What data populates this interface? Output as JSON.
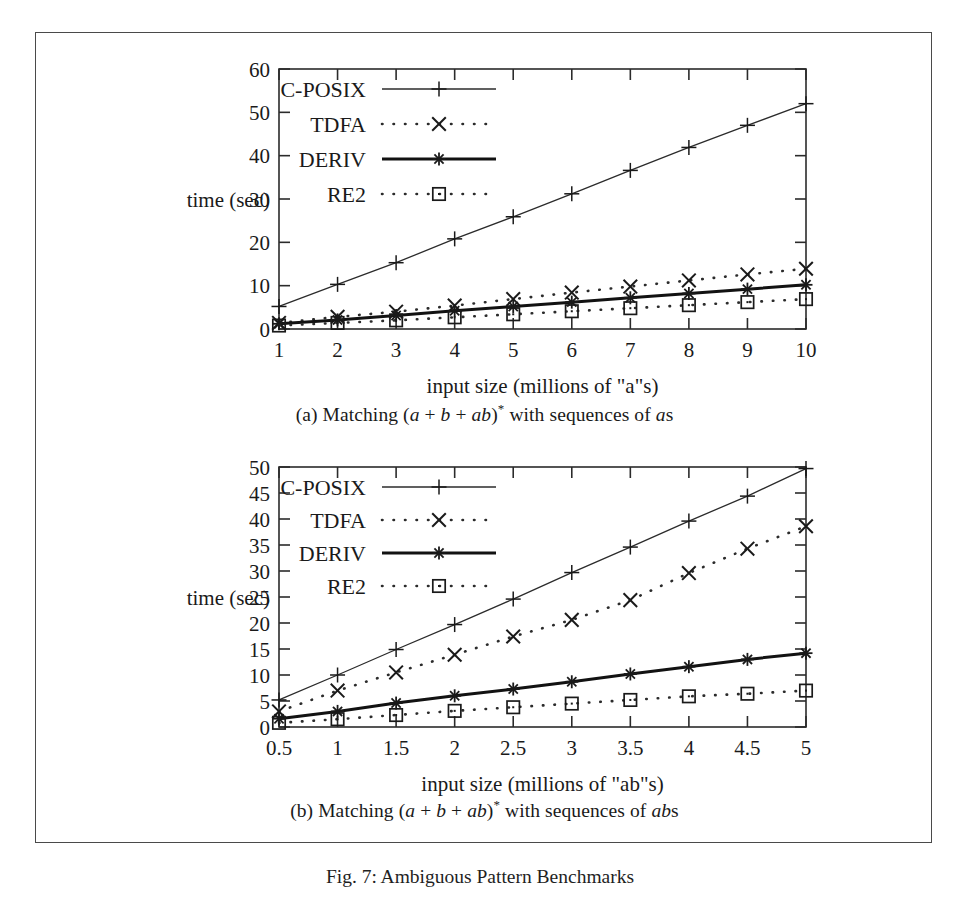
{
  "figure": {
    "caption_prefix": "Fig. 7:",
    "caption_text": "Fig. 7: Ambiguous Pattern Benchmarks"
  },
  "panel_a": {
    "caption_lead": "(a) Matching (",
    "caption_full": "(a) Matching (a + b + ab)* with sequences of as",
    "expr_a1": "a",
    "expr_plus1": " + ",
    "expr_b": "b",
    "expr_plus2": " + ",
    "expr_ab": "ab",
    "expr_close": ")",
    "expr_star": "*",
    "caption_tail": " with sequences of ",
    "caption_tail_ital": "a",
    "caption_tail_end": "s"
  },
  "panel_b": {
    "caption_lead": "(b) Matching (",
    "caption_full": "(b) Matching (a + b + ab)* with sequences of abs",
    "expr_a1": "a",
    "expr_plus1": " + ",
    "expr_b": "b",
    "expr_plus2": " + ",
    "expr_ab": "ab",
    "expr_close": ")",
    "expr_star": "*",
    "caption_tail": " with sequences of ",
    "caption_tail_ital": "ab",
    "caption_tail_end": "s"
  },
  "legend_markers": {
    "cposix": "plus-marker",
    "tdfa": "cross-marker",
    "deriv": "star-marker",
    "re2": "square-marker"
  },
  "chart_data": [
    {
      "id": "chart-a",
      "type": "line",
      "title": "",
      "xlabel": "input size (millions of \"a\"s)",
      "ylabel": "time (sec)",
      "xlim": [
        1,
        10
      ],
      "ylim": [
        0,
        60
      ],
      "xticks": [
        1,
        2,
        3,
        4,
        5,
        6,
        7,
        8,
        9,
        10
      ],
      "xtick_labels": [
        "1",
        "2",
        "3",
        "4",
        "5",
        "6",
        "7",
        "8",
        "9",
        "10"
      ],
      "yticks": [
        0,
        10,
        20,
        30,
        40,
        50,
        60
      ],
      "ytick_labels": [
        "0",
        "10",
        "20",
        "30",
        "40",
        "50",
        "60"
      ],
      "grid": false,
      "legend_position": "top-left-inside",
      "x": [
        1,
        2,
        3,
        4,
        5,
        6,
        7,
        8,
        9,
        10
      ],
      "series": [
        {
          "name": "C-POSIX",
          "marker": "plus",
          "style": "solid-thin",
          "values": [
            5.2,
            10.3,
            15.3,
            20.8,
            25.9,
            31.2,
            36.6,
            41.9,
            47.0,
            52.0
          ]
        },
        {
          "name": "TDFA",
          "marker": "cross",
          "style": "dotted",
          "values": [
            1.4,
            2.8,
            4.0,
            5.4,
            6.9,
            8.4,
            9.8,
            11.2,
            12.6,
            13.9
          ]
        },
        {
          "name": "DERIV",
          "marker": "star",
          "style": "solid-thick",
          "values": [
            1.2,
            2.1,
            3.1,
            4.2,
            5.2,
            6.2,
            7.2,
            8.2,
            9.2,
            10.2
          ]
        },
        {
          "name": "RE2",
          "marker": "square",
          "style": "dotted",
          "values": [
            0.8,
            1.4,
            2.0,
            2.7,
            3.4,
            4.1,
            4.8,
            5.5,
            6.2,
            6.9
          ]
        }
      ]
    },
    {
      "id": "chart-b",
      "type": "line",
      "title": "",
      "xlabel": "input size (millions of \"ab\"s)",
      "ylabel": "time (sec)",
      "xlim": [
        0.5,
        5
      ],
      "ylim": [
        0,
        50
      ],
      "xticks": [
        0.5,
        1,
        1.5,
        2,
        2.5,
        3,
        3.5,
        4,
        4.5,
        5
      ],
      "xtick_labels": [
        "0.5",
        "1",
        "1.5",
        "2",
        "2.5",
        "3",
        "3.5",
        "4",
        "4.5",
        "5"
      ],
      "yticks": [
        0,
        5,
        10,
        15,
        20,
        25,
        30,
        35,
        40,
        45,
        50
      ],
      "ytick_labels": [
        "0",
        "5",
        "10",
        "15",
        "20",
        "25",
        "30",
        "35",
        "40",
        "45",
        "50"
      ],
      "grid": false,
      "legend_position": "top-left-inside",
      "x": [
        0.5,
        1,
        1.5,
        2,
        2.5,
        3,
        3.5,
        4,
        4.5,
        5
      ],
      "series": [
        {
          "name": "C-POSIX",
          "marker": "plus",
          "style": "solid-thin",
          "values": [
            5.2,
            10.0,
            14.9,
            19.7,
            24.6,
            29.7,
            34.6,
            39.6,
            44.4,
            49.7
          ]
        },
        {
          "name": "TDFA",
          "marker": "cross",
          "style": "dotted",
          "values": [
            3.0,
            7.0,
            10.5,
            13.9,
            17.4,
            20.6,
            24.4,
            29.6,
            34.3,
            38.6
          ]
        },
        {
          "name": "DERIV",
          "marker": "star",
          "style": "solid-thick",
          "values": [
            1.6,
            3.0,
            4.6,
            6.0,
            7.3,
            8.7,
            10.2,
            11.6,
            13.0,
            14.2
          ]
        },
        {
          "name": "RE2",
          "marker": "square",
          "style": "dotted",
          "values": [
            0.8,
            1.5,
            2.3,
            3.1,
            3.8,
            4.5,
            5.2,
            5.9,
            6.4,
            7.0
          ]
        }
      ]
    }
  ]
}
